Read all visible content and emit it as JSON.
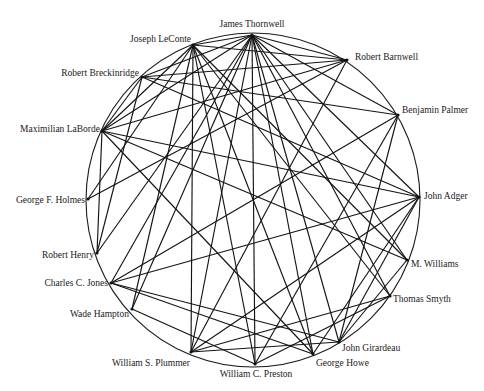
{
  "diagram": {
    "type": "circular network graph",
    "colors": {
      "line": "#141414",
      "background": "#ffffff",
      "text": "#1a1a1a"
    },
    "circle": {
      "cx": 253,
      "cy": 200,
      "r": 167
    },
    "nodes": [
      {
        "id": 0,
        "label": "James Thornwell",
        "x": 252,
        "y": 35,
        "lx": 252,
        "ly": 27,
        "anchor": "middle"
      },
      {
        "id": 1,
        "label": "Robert Barnwell",
        "x": 347,
        "y": 60,
        "lx": 355,
        "ly": 60,
        "anchor": "start"
      },
      {
        "id": 2,
        "label": "Benjamin Palmer",
        "x": 398,
        "y": 115,
        "lx": 402,
        "ly": 113,
        "anchor": "start"
      },
      {
        "id": 3,
        "label": "John Adger",
        "x": 419,
        "y": 197,
        "lx": 424,
        "ly": 199,
        "anchor": "start"
      },
      {
        "id": 4,
        "label": "M. Williams",
        "x": 407,
        "y": 260,
        "lx": 411,
        "ly": 267,
        "anchor": "start"
      },
      {
        "id": 5,
        "label": "Thomas Smyth",
        "x": 390,
        "y": 296,
        "lx": 393,
        "ly": 302,
        "anchor": "start"
      },
      {
        "id": 6,
        "label": "John Girardeau",
        "x": 339,
        "y": 342,
        "lx": 342,
        "ly": 351,
        "anchor": "start"
      },
      {
        "id": 7,
        "label": "George Howe",
        "x": 313,
        "y": 354,
        "lx": 316,
        "ly": 366,
        "anchor": "start"
      },
      {
        "id": 8,
        "label": "William C. Preston",
        "x": 255,
        "y": 364,
        "lx": 256,
        "ly": 377,
        "anchor": "middle"
      },
      {
        "id": 9,
        "label": "William S. Plummer",
        "x": 191,
        "y": 352,
        "lx": 190,
        "ly": 366,
        "anchor": "end"
      },
      {
        "id": 10,
        "label": "Wade Hampton",
        "x": 132,
        "y": 309,
        "lx": 129,
        "ly": 317,
        "anchor": "end"
      },
      {
        "id": 11,
        "label": "Charles C. Jones",
        "x": 111,
        "y": 283,
        "lx": 108,
        "ly": 286,
        "anchor": "end"
      },
      {
        "id": 12,
        "label": "Robert Henry",
        "x": 97,
        "y": 253,
        "lx": 94,
        "ly": 258,
        "anchor": "end"
      },
      {
        "id": 13,
        "label": "George F. Holmes",
        "x": 88,
        "y": 199,
        "lx": 85,
        "ly": 203,
        "anchor": "end"
      },
      {
        "id": 14,
        "label": "Maximilian LaBorde",
        "x": 102,
        "y": 131,
        "lx": 100,
        "ly": 132,
        "anchor": "end"
      },
      {
        "id": 15,
        "label": "Robert Breckinridge",
        "x": 142,
        "y": 77,
        "lx": 139,
        "ly": 76,
        "anchor": "end"
      },
      {
        "id": 16,
        "label": "Joseph LeConte",
        "x": 193,
        "y": 45,
        "lx": 191,
        "ly": 42,
        "anchor": "end"
      }
    ],
    "edges": [
      [
        0,
        1
      ],
      [
        0,
        2
      ],
      [
        0,
        3
      ],
      [
        0,
        4
      ],
      [
        0,
        5
      ],
      [
        0,
        6
      ],
      [
        0,
        7
      ],
      [
        0,
        8
      ],
      [
        0,
        9
      ],
      [
        0,
        10
      ],
      [
        0,
        11
      ],
      [
        0,
        12
      ],
      [
        0,
        14
      ],
      [
        0,
        15
      ],
      [
        0,
        16
      ],
      [
        16,
        1
      ],
      [
        16,
        14
      ],
      [
        16,
        10
      ],
      [
        16,
        7
      ],
      [
        16,
        4
      ],
      [
        16,
        8
      ],
      [
        16,
        9
      ],
      [
        15,
        2
      ],
      [
        15,
        3
      ],
      [
        15,
        14
      ],
      [
        15,
        1
      ],
      [
        1,
        14
      ],
      [
        1,
        9
      ],
      [
        1,
        13
      ],
      [
        2,
        11
      ],
      [
        2,
        6
      ],
      [
        2,
        8
      ],
      [
        14,
        12
      ],
      [
        14,
        4
      ],
      [
        14,
        7
      ],
      [
        14,
        3
      ],
      [
        13,
        16
      ],
      [
        12,
        15
      ],
      [
        11,
        3
      ],
      [
        11,
        6
      ],
      [
        11,
        7
      ],
      [
        10,
        8
      ],
      [
        9,
        3
      ],
      [
        9,
        5
      ],
      [
        9,
        6
      ],
      [
        8,
        5
      ],
      [
        3,
        6
      ],
      [
        3,
        7
      ],
      [
        5,
        16
      ],
      [
        6,
        4
      ]
    ]
  }
}
